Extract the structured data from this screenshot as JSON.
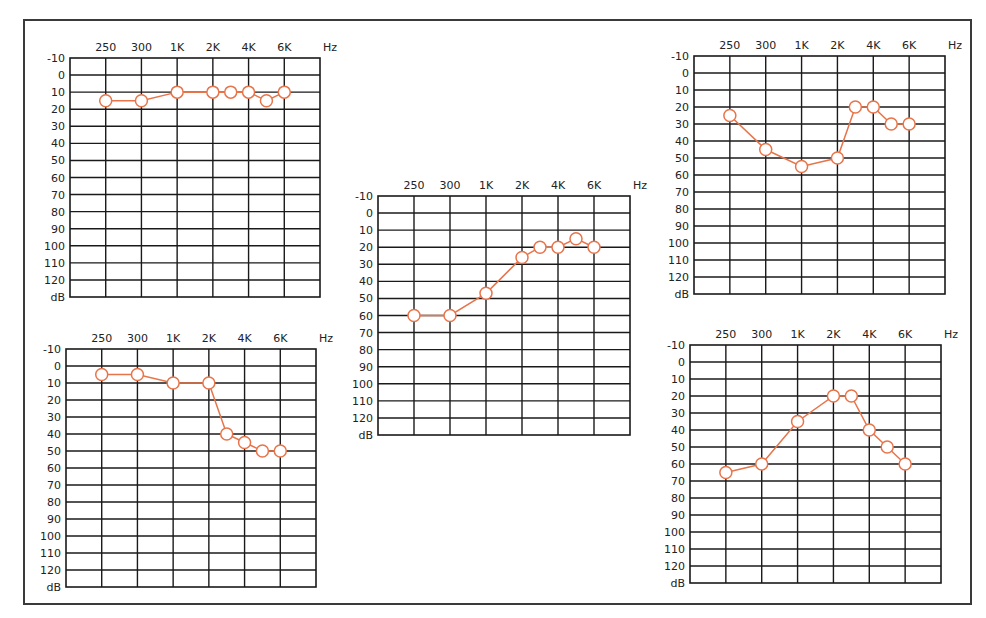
{
  "chart_data": [
    {
      "type": "line",
      "id": "audiogram-top-left",
      "title": "",
      "xlabel": "Hz",
      "ylabel": "dB",
      "x_tick_labels": [
        "250",
        "300",
        "1K",
        "2K",
        "4K",
        "6K"
      ],
      "y_tick_labels": [
        "-10",
        "0",
        "10",
        "20",
        "30",
        "40",
        "50",
        "60",
        "70",
        "80",
        "90",
        "100",
        "110",
        "120"
      ],
      "ylim": [
        -10,
        130
      ],
      "y_inverted": true,
      "grid": true,
      "x_positions": [
        1,
        2,
        3,
        4,
        4.5,
        5,
        5.5,
        6
      ],
      "x": [
        "250",
        "300",
        "1K",
        "2K",
        "3K",
        "4K",
        "5K",
        "6K"
      ],
      "values": [
        15,
        15,
        10,
        10,
        10,
        10,
        15,
        10
      ],
      "box": {
        "x": 70,
        "y": 58,
        "w": 250,
        "h": 239
      }
    },
    {
      "type": "line",
      "id": "audiogram-bottom-left",
      "title": "",
      "xlabel": "Hz",
      "ylabel": "dB",
      "x_tick_labels": [
        "250",
        "300",
        "1K",
        "2K",
        "4K",
        "6K"
      ],
      "y_tick_labels": [
        "-10",
        "0",
        "10",
        "20",
        "30",
        "40",
        "50",
        "60",
        "70",
        "80",
        "90",
        "100",
        "110",
        "120"
      ],
      "ylim": [
        -10,
        130
      ],
      "y_inverted": true,
      "grid": true,
      "x_positions": [
        1,
        2,
        3,
        4,
        4.5,
        5,
        5.5,
        6
      ],
      "x": [
        "250",
        "300",
        "1K",
        "2K",
        "3K",
        "4K",
        "5K",
        "6K"
      ],
      "values": [
        5,
        5,
        10,
        10,
        40,
        45,
        50,
        50
      ],
      "box": {
        "x": 66,
        "y": 349,
        "w": 250,
        "h": 238
      }
    },
    {
      "type": "line",
      "id": "audiogram-middle",
      "title": "",
      "xlabel": "Hz",
      "ylabel": "dB",
      "x_tick_labels": [
        "250",
        "300",
        "1K",
        "2K",
        "4K",
        "6K"
      ],
      "y_tick_labels": [
        "-10",
        "0",
        "10",
        "20",
        "30",
        "40",
        "50",
        "60",
        "70",
        "80",
        "90",
        "100",
        "110",
        "120"
      ],
      "ylim": [
        -10,
        130
      ],
      "y_inverted": true,
      "grid": true,
      "x_positions": [
        1,
        2,
        3,
        4,
        4.5,
        5,
        5.5,
        6
      ],
      "x": [
        "250",
        "300",
        "1K",
        "2K",
        "3K",
        "4K",
        "5K",
        "6K"
      ],
      "values": [
        60,
        60,
        47,
        26,
        20,
        20,
        15,
        20
      ],
      "box": {
        "x": 378,
        "y": 196,
        "w": 252,
        "h": 239
      }
    },
    {
      "type": "line",
      "id": "audiogram-top-right",
      "title": "",
      "xlabel": "Hz",
      "ylabel": "dB",
      "x_tick_labels": [
        "250",
        "300",
        "1K",
        "2K",
        "4K",
        "6K"
      ],
      "y_tick_labels": [
        "-10",
        "0",
        "10",
        "20",
        "30",
        "40",
        "50",
        "60",
        "70",
        "80",
        "90",
        "100",
        "110",
        "120"
      ],
      "ylim": [
        -10,
        130
      ],
      "y_inverted": true,
      "grid": true,
      "x_positions": [
        1,
        2,
        3,
        4,
        4.5,
        5,
        5.5,
        6
      ],
      "x": [
        "250",
        "300",
        "1K",
        "2K",
        "3K",
        "4K",
        "5K",
        "6K"
      ],
      "values": [
        25,
        45,
        55,
        50,
        20,
        20,
        30,
        30
      ],
      "box": {
        "x": 694,
        "y": 56,
        "w": 251,
        "h": 238
      }
    },
    {
      "type": "line",
      "id": "audiogram-bottom-right",
      "title": "",
      "xlabel": "Hz",
      "ylabel": "dB",
      "x_tick_labels": [
        "250",
        "300",
        "1K",
        "2K",
        "4K",
        "6K"
      ],
      "y_tick_labels": [
        "-10",
        "0",
        "10",
        "20",
        "30",
        "40",
        "50",
        "60",
        "70",
        "80",
        "90",
        "100",
        "110",
        "120"
      ],
      "ylim": [
        -10,
        130
      ],
      "y_inverted": true,
      "grid": true,
      "x_positions": [
        1,
        2,
        3,
        4,
        4.5,
        5,
        5.5,
        6
      ],
      "x": [
        "250",
        "300",
        "1K",
        "2K",
        "3K",
        "4K",
        "5K",
        "6K"
      ],
      "values": [
        65,
        60,
        35,
        20,
        20,
        40,
        50,
        60
      ],
      "box": {
        "x": 690,
        "y": 345,
        "w": 251,
        "h": 238
      }
    }
  ],
  "labels": {
    "x_unit": "Hz",
    "y_unit": "dB"
  },
  "colors": {
    "series": "#E8744A",
    "grid": "#1a1a1a",
    "text": "#222222",
    "frame": "#3a3a3a"
  }
}
